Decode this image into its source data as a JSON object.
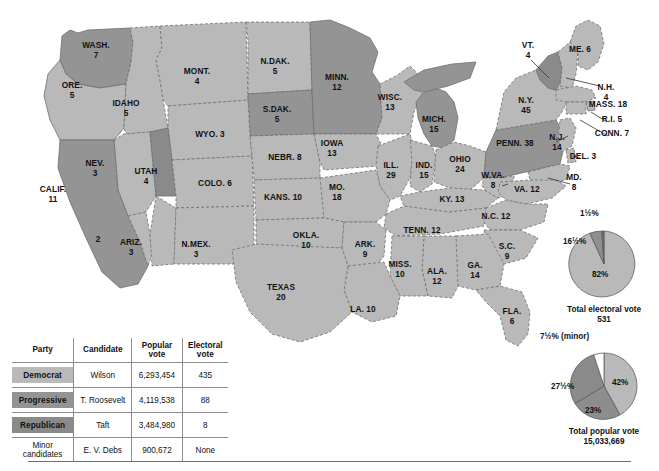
{
  "colors": {
    "democrat": "#b9b9b9",
    "progressive": "#949494",
    "republican": "#8a8a8a",
    "minor": "#ffffff",
    "outline": "#6f6f6f",
    "background": "#ffffff"
  },
  "states": [
    {
      "name": "WASH.",
      "votes": "7",
      "party": "progressive",
      "x": 96,
      "y": 46
    },
    {
      "name": "ORE.",
      "votes": "5",
      "party": "democrat",
      "x": 72,
      "y": 86
    },
    {
      "name": "IDAHO",
      "votes": "5",
      "party": "democrat",
      "x": 126,
      "y": 104
    },
    {
      "name": "MONT.",
      "votes": "4",
      "party": "democrat",
      "x": 197,
      "y": 72
    },
    {
      "name": "N.DAK.",
      "votes": "5",
      "party": "democrat",
      "x": 275,
      "y": 62
    },
    {
      "name": "S.DAK.",
      "votes": "5",
      "party": "progressive",
      "x": 277,
      "y": 110
    },
    {
      "name": "MINN.",
      "votes": "12",
      "party": "progressive",
      "x": 337,
      "y": 78
    },
    {
      "name": "WISC.",
      "votes": "13",
      "party": "democrat",
      "x": 390,
      "y": 98
    },
    {
      "name": "MICH.",
      "votes": "15",
      "party": "progressive",
      "x": 434,
      "y": 120
    },
    {
      "name": "WYO. 3",
      "votes": "",
      "party": "democrat",
      "x": 210,
      "y": 135
    },
    {
      "name": "NEV.",
      "votes": "3",
      "party": "democrat",
      "x": 95,
      "y": 164
    },
    {
      "name": "UTAH",
      "votes": "4",
      "party": "republican",
      "x": 146,
      "y": 172
    },
    {
      "name": "COLO. 6",
      "votes": "",
      "party": "democrat",
      "x": 215,
      "y": 184
    },
    {
      "name": "NEBR. 8",
      "votes": "",
      "party": "democrat",
      "x": 285,
      "y": 158
    },
    {
      "name": "IOWA",
      "votes": "13",
      "party": "democrat",
      "x": 332,
      "y": 144
    },
    {
      "name": "ILL.",
      "votes": "29",
      "party": "democrat",
      "x": 391,
      "y": 166
    },
    {
      "name": "IND.",
      "votes": "15",
      "party": "democrat",
      "x": 424,
      "y": 166
    },
    {
      "name": "OHIO",
      "votes": "24",
      "party": "democrat",
      "x": 460,
      "y": 160
    },
    {
      "name": "PENN. 38",
      "votes": "",
      "party": "progressive",
      "x": 515,
      "y": 144
    },
    {
      "name": "N.Y.",
      "votes": "45",
      "party": "democrat",
      "x": 526,
      "y": 101
    },
    {
      "name": "VT.",
      "votes": "4",
      "party": "republican",
      "x": 528,
      "y": 46
    },
    {
      "name": "ME. 6",
      "votes": "",
      "party": "democrat",
      "x": 580,
      "y": 50
    },
    {
      "name": "N.H.",
      "votes": "4",
      "party": "democrat",
      "x": 606,
      "y": 88
    },
    {
      "name": "MASS. 18",
      "votes": "",
      "party": "democrat",
      "x": 608,
      "y": 105
    },
    {
      "name": "R.I. 5",
      "votes": "",
      "party": "democrat",
      "x": 612,
      "y": 120
    },
    {
      "name": "CONN. 7",
      "votes": "",
      "party": "democrat",
      "x": 612,
      "y": 134
    },
    {
      "name": "N.J.",
      "votes": "14",
      "party": "democrat",
      "x": 557,
      "y": 138
    },
    {
      "name": "DEL. 3",
      "votes": "",
      "party": "democrat",
      "x": 583,
      "y": 157
    },
    {
      "name": "MD.",
      "votes": "8",
      "party": "democrat",
      "x": 574,
      "y": 178
    },
    {
      "name": "W.VA.",
      "votes": "8",
      "party": "democrat",
      "x": 493,
      "y": 176
    },
    {
      "name": "VA. 12",
      "votes": "",
      "party": "democrat",
      "x": 527,
      "y": 190
    },
    {
      "name": "KY. 13",
      "votes": "",
      "party": "democrat",
      "x": 452,
      "y": 200
    },
    {
      "name": "MO.",
      "votes": "18",
      "party": "democrat",
      "x": 337,
      "y": 188
    },
    {
      "name": "KANS. 10",
      "votes": "",
      "party": "democrat",
      "x": 283,
      "y": 198
    },
    {
      "name": "CALIF.",
      "votes": "11",
      "party": "progressive",
      "x": 53,
      "y": 190
    },
    {
      "name": "2",
      "votes": "",
      "party": "democrat",
      "x": 98,
      "y": 240
    },
    {
      "name": "ARIZ.",
      "votes": "3",
      "party": "democrat",
      "x": 131,
      "y": 243
    },
    {
      "name": "N.MEX.",
      "votes": "3",
      "party": "democrat",
      "x": 196,
      "y": 245
    },
    {
      "name": "OKLA.",
      "votes": "10",
      "party": "democrat",
      "x": 306,
      "y": 236
    },
    {
      "name": "ARK.",
      "votes": "9",
      "party": "democrat",
      "x": 365,
      "y": 245
    },
    {
      "name": "TENN. 12",
      "votes": "",
      "party": "democrat",
      "x": 422,
      "y": 231
    },
    {
      "name": "N.C. 12",
      "votes": "",
      "party": "democrat",
      "x": 496,
      "y": 217
    },
    {
      "name": "S.C.",
      "votes": "9",
      "party": "democrat",
      "x": 507,
      "y": 247
    },
    {
      "name": "MISS.",
      "votes": "10",
      "party": "democrat",
      "x": 400,
      "y": 265
    },
    {
      "name": "ALA.",
      "votes": "12",
      "party": "democrat",
      "x": 437,
      "y": 272
    },
    {
      "name": "GA.",
      "votes": "14",
      "party": "democrat",
      "x": 475,
      "y": 266
    },
    {
      "name": "TEXAS",
      "votes": "20",
      "party": "democrat",
      "x": 281,
      "y": 288
    },
    {
      "name": "LA. 10",
      "votes": "",
      "party": "democrat",
      "x": 363,
      "y": 310
    },
    {
      "name": "FLA.",
      "votes": "6",
      "party": "democrat",
      "x": 512,
      "y": 312
    }
  ],
  "table": {
    "headers": {
      "party": "Party",
      "candidate": "Candidate",
      "popular_vote_l1": "Popular",
      "popular_vote_l2": "vote",
      "electoral_vote_l1": "Electoral",
      "electoral_vote_l2": "vote"
    },
    "rows": [
      {
        "party": "Democrat",
        "swatch": "dem",
        "candidate": "Wilson",
        "popular": "6,293,454",
        "electoral": "435"
      },
      {
        "party": "Progressive",
        "swatch": "prog",
        "candidate": "T. Roosevelt",
        "popular": "4,119,538",
        "electoral": "88"
      },
      {
        "party": "Republican",
        "swatch": "rep",
        "candidate": "Taft",
        "popular": "3,484,980",
        "electoral": "8"
      },
      {
        "party_l1": "Minor",
        "party_l2": "candidates",
        "swatch": "none",
        "candidate": "E. V. Debs",
        "popular": "900,672",
        "electoral": "None"
      }
    ]
  },
  "chart_data": [
    {
      "type": "pie",
      "title": "Total electoral vote",
      "subtitle": "531",
      "labels": [
        "Democrat",
        "Progressive",
        "Republican"
      ],
      "values": [
        82,
        16.5,
        1.5
      ],
      "value_labels": [
        "82%",
        "16½%",
        "1½%"
      ],
      "colors": [
        "#b9b9b9",
        "#8f8f8f",
        "#6e6e6e"
      ],
      "total": "531",
      "legend": "none"
    },
    {
      "type": "pie",
      "title": "Total popular vote",
      "subtitle": "15,033,669",
      "labels": [
        "Democrat",
        "Republican",
        "Progressive",
        "Minor"
      ],
      "values": [
        42,
        23,
        27.5,
        7.5
      ],
      "value_labels": [
        "42%",
        "23%",
        "27½%",
        "7½% (minor)"
      ],
      "colors": [
        "#b9b9b9",
        "#8d8d8d",
        "#8a8a8a",
        "#ffffff"
      ],
      "total": "15,033,669",
      "legend": "none"
    }
  ],
  "pie_electoral": {
    "caption_l1": "Total electoral vote",
    "caption_l2": "531",
    "pct_major": "82%",
    "pct_mid": "16½%",
    "pct_small": "1½%"
  },
  "pie_popular": {
    "caption_l1": "Total popular vote",
    "caption_l2": "15,033,669",
    "pct_dem": "42%",
    "pct_rep": "23%",
    "pct_prog": "27½%",
    "pct_minor": "7½% (minor)"
  }
}
